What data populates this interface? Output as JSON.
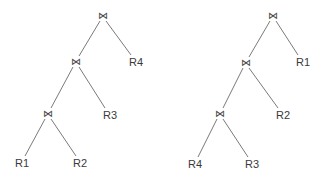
{
  "diagram": {
    "join_symbol": "⋈",
    "trees": [
      {
        "name": "left-tree",
        "joins": [
          {
            "symbol": "⋈",
            "x": 103,
            "y": 16
          },
          {
            "symbol": "⋈",
            "x": 76,
            "y": 62
          },
          {
            "symbol": "⋈",
            "x": 48,
            "y": 114
          }
        ],
        "leaves": [
          {
            "label": "R4",
            "x": 136,
            "y": 62
          },
          {
            "label": "R3",
            "x": 110,
            "y": 115
          },
          {
            "label": "R1",
            "x": 22,
            "y": 163
          },
          {
            "label": "R2",
            "x": 80,
            "y": 163
          }
        ]
      },
      {
        "name": "right-tree",
        "joins": [
          {
            "symbol": "⋈",
            "x": 273,
            "y": 16
          },
          {
            "symbol": "⋈",
            "x": 246,
            "y": 63
          },
          {
            "symbol": "⋈",
            "x": 220,
            "y": 114
          }
        ],
        "leaves": [
          {
            "label": "R1",
            "x": 303,
            "y": 62
          },
          {
            "label": "R2",
            "x": 283,
            "y": 115
          },
          {
            "label": "R4",
            "x": 195,
            "y": 164
          },
          {
            "label": "R3",
            "x": 252,
            "y": 164
          }
        ]
      }
    ]
  }
}
